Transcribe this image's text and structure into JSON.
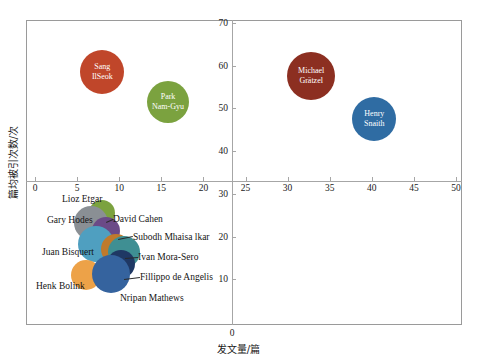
{
  "chart_data": {
    "type": "scatter",
    "title": "",
    "xlabel": "发文量/篇",
    "ylabel": "篇均被引次数/次",
    "xlim": [
      0,
      50
    ],
    "ylim": [
      0,
      70
    ],
    "xticks": [
      0,
      5,
      10,
      15,
      20,
      25,
      30,
      35,
      40,
      45,
      50
    ],
    "yticks": [
      0,
      10,
      20,
      30,
      40,
      50,
      60,
      70
    ],
    "grid": false,
    "legend": "none",
    "note": "Bubble chart: x = publication count, y = average citations per paper, bubble size = relative magnitude",
    "points": [
      {
        "name": "Sang IlSeok",
        "label": "Sang\nIlSeok",
        "x": 8,
        "y": 58.5,
        "r": 22,
        "color": "#c0462a",
        "label_mode": "inside"
      },
      {
        "name": "Park Nam-Gyu",
        "label": "Park\nNam-Gyu",
        "x": 15.8,
        "y": 51.5,
        "r": 21,
        "color": "#7ba23f",
        "label_mode": "inside"
      },
      {
        "name": "Michael Gratzel",
        "label": "Michael\nGrätzel",
        "x": 32.8,
        "y": 57.5,
        "r": 24,
        "color": "#8c2f21",
        "label_mode": "inside"
      },
      {
        "name": "Henry Snaith",
        "label": "Henry\nSnaith",
        "x": 40.3,
        "y": 47.5,
        "r": 22,
        "color": "#2f6ca3",
        "label_mode": "inside"
      },
      {
        "name": "Lioz Etgar",
        "label": "Lioz Etgar",
        "x": 7.9,
        "y": 25.5,
        "r": 13,
        "color": "#7ba23f",
        "label_mode": "outside"
      },
      {
        "name": "Gary Hodes",
        "label": "Gary Hodes",
        "x": 6.6,
        "y": 23.2,
        "r": 17,
        "color": "#8a8f94",
        "label_mode": "outside"
      },
      {
        "name": "David Cahen",
        "label": "David Cahen",
        "x": 8.4,
        "y": 21.4,
        "r": 14,
        "color": "#6b4a87",
        "label_mode": "outside"
      },
      {
        "name": "Juan Bisquert",
        "label": "Juan Bisquert",
        "x": 7.2,
        "y": 18.3,
        "r": 18,
        "color": "#4f9fc0",
        "label_mode": "outside"
      },
      {
        "name": "Subodh Mhaisalkar",
        "label": "Subodh  Mhaisa lkar",
        "x": 9.6,
        "y": 17.2,
        "r": 15,
        "color": "#c07a2c",
        "label_mode": "outside"
      },
      {
        "name": "Ivan Mora-Sero",
        "label": "Ivan Mora-Sero",
        "x": 10.6,
        "y": 16.4,
        "r": 16,
        "color": "#3f8f93",
        "label_mode": "outside"
      },
      {
        "name": "Fillippo de Angelis",
        "label": "Fillippo de Angelis",
        "x": 10.2,
        "y": 13.6,
        "r": 14,
        "color": "#1f3864",
        "label_mode": "outside"
      },
      {
        "name": "Henk Bolink",
        "label": "Henk Bolink",
        "x": 6.0,
        "y": 11.0,
        "r": 15,
        "color": "#eda248",
        "label_mode": "outside"
      },
      {
        "name": "Nripan Mathews",
        "label": "Nripan Mathews",
        "x": 9.0,
        "y": 11.2,
        "r": 19,
        "color": "#35639e",
        "label_mode": "outside"
      }
    ]
  },
  "axis": {
    "x_tick_labels": [
      "0",
      "5",
      "10",
      "15",
      "20",
      "25",
      "30",
      "35",
      "40",
      "45",
      "50"
    ],
    "y_tick_labels_upper": [
      "70",
      "60",
      "50",
      "40"
    ],
    "y_tick_labels_lower": [
      "30",
      "20",
      "10"
    ],
    "origin_label": "0",
    "x_title": "发文量/篇",
    "y_title": "篇均被引次数/次"
  },
  "labels": {
    "lioz_etgar": "Lioz Etgar",
    "gary_hodes": "Gary Hodes",
    "david_cahen": "David Cahen",
    "juan_bisquert": "Juan Bisquert",
    "subodh": "Subodh  Mhaisa lkar",
    "ivan": "Ivan Mora-Sero",
    "fillippo": "Fillippo de Angelis",
    "henk": "Henk Bolink",
    "nripan": "Nripan Mathews",
    "sang": "Sang\nIlSeok",
    "park": "Park\nNam-Gyu",
    "michael": "Michael\nGrätzel",
    "henry": "Henry\nSnaith"
  }
}
